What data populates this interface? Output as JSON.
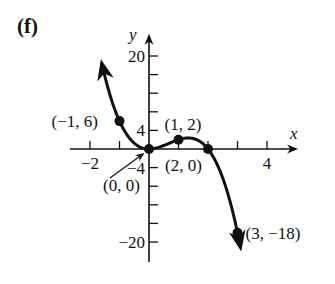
{
  "panel_label": "(f)",
  "chart_data": {
    "type": "line",
    "title": "",
    "function": "f(x) = 4x^2 - 2x^3",
    "xlabel": "x",
    "ylabel": "y",
    "xlim": [
      -2.5,
      4.9
    ],
    "ylim": [
      -24,
      22
    ],
    "x_ticks": [
      -2,
      -1,
      1,
      2,
      3,
      4
    ],
    "x_tick_labels": [
      {
        "value": -2,
        "label": "−2"
      },
      {
        "value": 4,
        "label": "4"
      }
    ],
    "y_ticks": [
      20,
      16,
      12,
      8,
      4,
      -4,
      -8,
      -12,
      -16,
      -20
    ],
    "y_tick_labels": [
      {
        "value": 20,
        "label": "20"
      },
      {
        "value": 4,
        "label": "4"
      },
      {
        "value": -4,
        "label": "−4"
      },
      {
        "value": -20,
        "label": "−20"
      }
    ],
    "grid": false,
    "legend": null,
    "series": [
      {
        "name": "f(x)",
        "x": [
          -1.6,
          -1.5,
          -1.25,
          -1,
          -0.75,
          -0.5,
          -0.25,
          0,
          0.25,
          0.5,
          0.75,
          1,
          1.25,
          1.5,
          1.75,
          2,
          2.25,
          2.5,
          2.75,
          3,
          3.1
        ],
        "y": [
          18.43,
          15.75,
          10.16,
          6,
          3.09,
          1.25,
          0.28,
          0,
          0.22,
          0.75,
          1.41,
          2,
          2.34,
          2.25,
          1.53,
          0,
          -2.53,
          -6.25,
          -11.34,
          -18,
          -20.13
        ]
      }
    ],
    "annotations": [
      {
        "x": -1,
        "y": 6,
        "label": "(−1, 6)"
      },
      {
        "x": 0,
        "y": 0,
        "label": "(0, 0)",
        "arrow": true
      },
      {
        "x": 1,
        "y": 2,
        "label": "(1, 2)"
      },
      {
        "x": 2,
        "y": 0,
        "label": "(2, 0)"
      },
      {
        "x": 3,
        "y": -18,
        "label": "(3, −18)"
      }
    ]
  }
}
